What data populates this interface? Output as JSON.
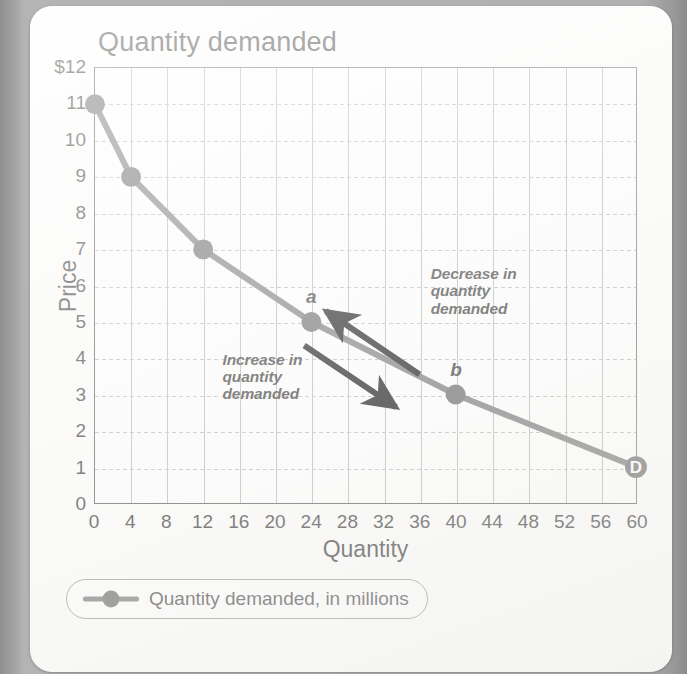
{
  "card": {
    "title": "Quantity demanded"
  },
  "chart_data": {
    "type": "line",
    "title": "Quantity demanded",
    "xlabel": "Quantity",
    "ylabel": "Price",
    "xlim": [
      0,
      60
    ],
    "ylim": [
      0,
      12
    ],
    "xticks": [
      "0",
      "4",
      "8",
      "12",
      "16",
      "20",
      "24",
      "28",
      "32",
      "36",
      "40",
      "44",
      "48",
      "52",
      "56",
      "60"
    ],
    "yticks": [
      "0",
      "1",
      "2",
      "3",
      "4",
      "5",
      "6",
      "7",
      "8",
      "9",
      "10",
      "11",
      "$12"
    ],
    "grid": "both",
    "legend_position": "below-plot",
    "series": [
      {
        "name": "Quantity demanded, in millions",
        "color": "#7d7d7d",
        "x": [
          0,
          4,
          12,
          24,
          40,
          60
        ],
        "y": [
          11,
          9,
          7,
          5,
          3,
          1
        ]
      }
    ],
    "point_labels": [
      {
        "label": "a",
        "x": 24,
        "y": 5
      },
      {
        "label": "b",
        "x": 40,
        "y": 3
      },
      {
        "label": "D",
        "x": 60,
        "y": 1
      }
    ],
    "annotations": [
      {
        "text": "Decrease in\nquantity\ndemanded",
        "line1": "Decrease in",
        "line2": "quantity",
        "line3": "demanded",
        "arrow_direction": "up-left",
        "arrow_from": {
          "x": 36,
          "y": 3.55
        },
        "arrow_to": {
          "x": 25.6,
          "y": 5.3
        }
      },
      {
        "text": "Increase in\nquantity\ndemanded",
        "line1": "Increase in",
        "line2": "quantity",
        "line3": "demanded",
        "arrow_direction": "down-right",
        "arrow_from": {
          "x": 23.2,
          "y": 4.35
        },
        "arrow_to": {
          "x": 33.4,
          "y": 2.65
        }
      }
    ]
  },
  "legend": {
    "marker_icon": "line-with-dot-icon",
    "label": "Quantity demanded, in millions"
  },
  "colors": {
    "series": "#7d7d7d",
    "marker": "#6e6e6e",
    "arrow": "#1d1d1d",
    "grid": "#b9b9b9",
    "axis": "#5d5d5d",
    "text": "#3d3d3d",
    "card_bg": "#fdfdfc",
    "page_bg": "#9e9e9e"
  }
}
